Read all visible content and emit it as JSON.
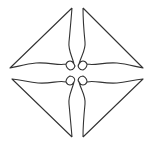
{
  "diagram": {
    "stroke_color": "#333333",
    "background": "#ffffff",
    "quadrants": [
      "top-left",
      "top-right",
      "bottom-left",
      "bottom-right"
    ]
  }
}
